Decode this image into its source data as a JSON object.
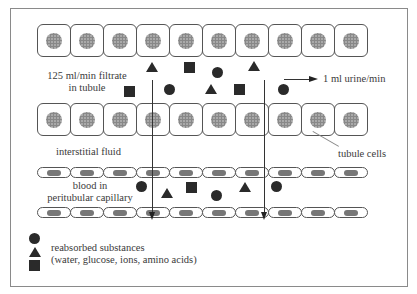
{
  "diagram": {
    "labels": {
      "filtrate_line1": "125 ml/min filtrate",
      "filtrate_line2": "in tubule",
      "urine": "1 ml urine/min",
      "interstitial": "interstitial fluid",
      "tubule_cells": "tubule cells",
      "blood_line1": "blood in",
      "blood_line2": "peritubular capillary"
    },
    "rows": {
      "upper_tubule_cells": 10,
      "lower_tubule_cells": 10,
      "upper_capillary_cells": 10,
      "lower_capillary_cells": 10
    },
    "symbols_in_tubule": [
      {
        "shape": "triangle",
        "x": 146,
        "y": 62
      },
      {
        "shape": "square",
        "x": 184,
        "y": 62
      },
      {
        "shape": "circle",
        "x": 212,
        "y": 67
      },
      {
        "shape": "triangle",
        "x": 248,
        "y": 61
      },
      {
        "shape": "square",
        "x": 124,
        "y": 86
      },
      {
        "shape": "circle",
        "x": 164,
        "y": 84
      },
      {
        "shape": "triangle",
        "x": 205,
        "y": 84
      },
      {
        "shape": "square",
        "x": 234,
        "y": 84
      },
      {
        "shape": "circle",
        "x": 278,
        "y": 84
      }
    ],
    "symbols_in_blood": [
      {
        "shape": "circle",
        "x": 136,
        "y": 181
      },
      {
        "shape": "triangle",
        "x": 161,
        "y": 188
      },
      {
        "shape": "square",
        "x": 186,
        "y": 182
      },
      {
        "shape": "circle",
        "x": 211,
        "y": 190
      },
      {
        "shape": "triangle",
        "x": 239,
        "y": 182
      },
      {
        "shape": "circle",
        "x": 271,
        "y": 181
      }
    ],
    "legend": {
      "symbols": [
        "circle",
        "triangle",
        "square"
      ],
      "line1": "reabsorbed substances",
      "line2": "(water, glucose, ions, amino acids)"
    }
  }
}
